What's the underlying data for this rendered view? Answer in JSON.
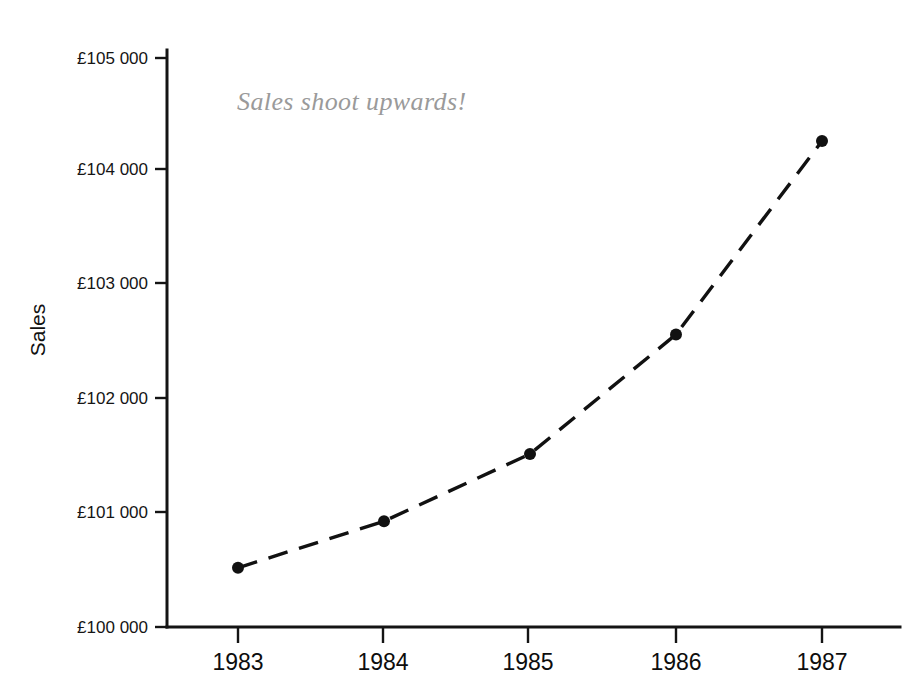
{
  "chart_data": {
    "type": "line",
    "title": "",
    "subtitle": "",
    "xlabel": "",
    "ylabel": "Sales",
    "categories": [
      "1983",
      "1984",
      "1985",
      "1986",
      "1987"
    ],
    "x": [
      1983,
      1984,
      1985,
      1986,
      1987
    ],
    "values": [
      100520,
      100930,
      101520,
      102570,
      104270
    ],
    "series": [
      {
        "name": "Sales",
        "values": [
          100520,
          100930,
          101520,
          102570,
          104270
        ]
      }
    ],
    "ylim": [
      100000,
      105000
    ],
    "ytick_values": [
      100000,
      101000,
      102000,
      103000,
      104000,
      105000
    ],
    "ytick_labels": [
      "£100 000",
      "£101 000",
      "£102 000",
      "£103 000",
      "£104 000",
      "£105 000"
    ],
    "xtick_labels": [
      "1983",
      "1984",
      "1985",
      "1986",
      "1987"
    ],
    "grid": false,
    "legend": false,
    "legend_position": "none",
    "line_style": "dashed",
    "marker": "filled-circle",
    "annotations": [
      {
        "text": "Sales shoot upwards!",
        "style": "italic-serif-gray",
        "color": "#9a9a9a",
        "x": 1983.4,
        "y": 104600
      }
    ],
    "colors": {
      "line": "#111111",
      "marker": "#111111",
      "axis": "#141414",
      "annotation": "#9a9a9a",
      "background": "#ffffff"
    }
  },
  "axes": {
    "y_title": "Sales",
    "y_ticks": [
      {
        "label": "£105 000",
        "value": 105000
      },
      {
        "label": "£104 000",
        "value": 104000
      },
      {
        "label": "£103 000",
        "value": 103000
      },
      {
        "label": "£102 000",
        "value": 102000
      },
      {
        "label": "£101 000",
        "value": 101000
      },
      {
        "label": "£100 000",
        "value": 100000
      }
    ],
    "x_ticks": [
      {
        "label": "1983"
      },
      {
        "label": "1984"
      },
      {
        "label": "1985"
      },
      {
        "label": "1986"
      },
      {
        "label": "1987"
      }
    ]
  },
  "annotation": {
    "text": "Sales shoot upwards!"
  },
  "cropped_caption": {
    "text": "line graph"
  }
}
